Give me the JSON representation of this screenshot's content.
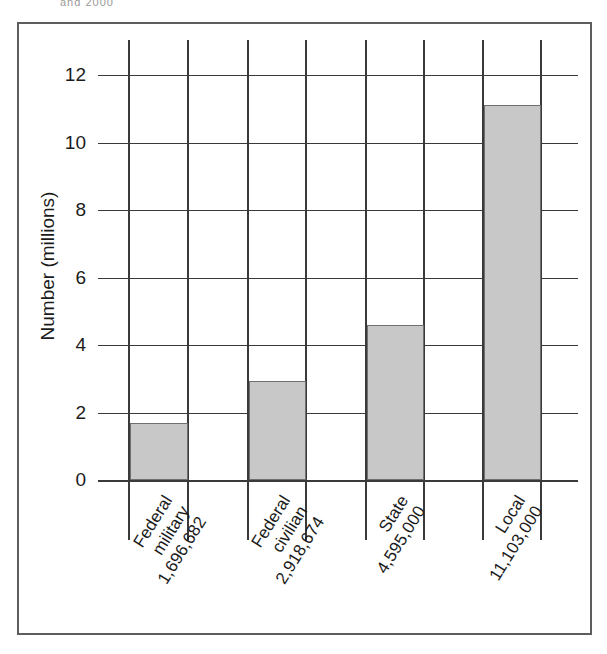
{
  "top_caption": "and 2000",
  "bottom_caption": "",
  "chart_data": {
    "type": "bar",
    "title": "",
    "xlabel": "",
    "ylabel": "Number (millions)",
    "ylim": [
      0,
      12
    ],
    "yticks": [
      0,
      2,
      4,
      6,
      8,
      10,
      12
    ],
    "ytick_labels": [
      "0",
      "2",
      "4",
      "6",
      "8",
      "10",
      "12"
    ],
    "grid": true,
    "legend": "none",
    "categories": [
      "Federal military",
      "Federal civilian",
      "State",
      "Local"
    ],
    "category_lines": [
      [
        "Federal",
        "military",
        "1,696,682"
      ],
      [
        "Federal",
        "civilian",
        "2,918,674"
      ],
      [
        "State",
        "4,595,000"
      ],
      [
        "Local",
        "11,103,000"
      ]
    ],
    "value_labels": [
      "1,696,682",
      "2,918,674",
      "4,595,000",
      "11,103,000"
    ],
    "values": [
      1.696682,
      2.918674,
      4.595,
      11.103
    ],
    "bar_color": "#c8c8c8",
    "bar_edge_color": "#6f6f6f",
    "grid_color": "#3a3a3a",
    "frame_color": "#5d5d5d"
  }
}
